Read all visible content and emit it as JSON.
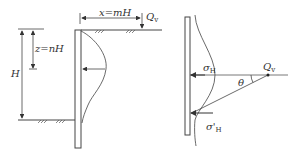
{
  "left_figure": {
    "dim_x_label": "x=mH",
    "dim_z_label": "z=nH",
    "dim_h_label": "H",
    "load_label": "Q",
    "load_sub": "v"
  },
  "right_figure": {
    "sigma_label": "σ",
    "sigma_sub": "H",
    "sigma_prime_label": "σ'",
    "sigma_prime_sub": "H",
    "theta_label": "θ",
    "load_label": "Q",
    "load_sub": "v"
  },
  "colors": {
    "line": "#444444",
    "text": "#333333"
  }
}
